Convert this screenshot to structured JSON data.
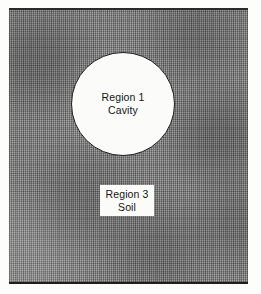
{
  "figure": {
    "name": "cavity-in-soil-cross-section",
    "background_color": "#ffffff",
    "frame": {
      "fill_color": "#8e8e8e",
      "border_color": "#1f1f1f",
      "pattern": "crosshatch-hatching"
    }
  },
  "cavity": {
    "shape": "circle",
    "fill_color": "#fbfbfa",
    "outline_color": "#1c1c1c",
    "label_line1": "Region 1",
    "label_line2": "Cavity"
  },
  "soil": {
    "shape": "rectangle",
    "fill_color": "#8e8e8e",
    "label_line1": "Region 3",
    "label_line2": "Soil",
    "label_box_fill": "#fbfbfa"
  }
}
